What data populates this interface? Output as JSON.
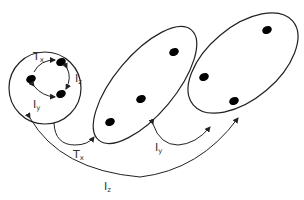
{
  "diagram": {
    "colors": {
      "line": "#222222",
      "dot": "#000000",
      "text": "#333333"
    },
    "inner_labels": [
      {
        "main": "T",
        "sub": "x"
      },
      {
        "main": "I",
        "sub": "z"
      },
      {
        "main": "I",
        "sub": "y"
      }
    ],
    "outer_labels": [
      {
        "main": "T",
        "sub": "x"
      },
      {
        "main": "I",
        "sub": "y"
      },
      {
        "main": "I",
        "sub": "z"
      }
    ]
  }
}
